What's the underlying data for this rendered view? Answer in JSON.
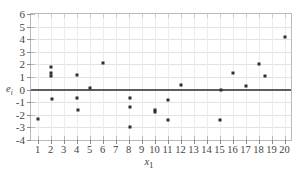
{
  "chart_data": {
    "type": "scatter",
    "title": "",
    "xlabel": "x1",
    "ylabel": "e_i",
    "xlim": [
      0.5,
      20.5
    ],
    "ylim": [
      -4,
      6
    ],
    "grid": true,
    "legend": null,
    "reference_line": {
      "axis": "y",
      "value": 0,
      "color": "#5d5d5d"
    },
    "marker_color": "#2f2f2f",
    "xticks": [
      1,
      2,
      3,
      4,
      5,
      6,
      7,
      8,
      9,
      10,
      11,
      12,
      13,
      14,
      15,
      16,
      17,
      18,
      19,
      20
    ],
    "xtick_labels": [
      "1",
      "2",
      "3",
      "4",
      "5",
      "6",
      "7",
      "8",
      "9",
      "10",
      "11",
      "12",
      "13",
      "14",
      "15",
      "16",
      "17",
      "18",
      "19",
      "20"
    ],
    "yticks": [
      -4,
      -3,
      -2,
      -1,
      0,
      1,
      2,
      3,
      4,
      5,
      6
    ],
    "ytick_labels": [
      "-4",
      "-3",
      "-2",
      "-1",
      "0",
      "1",
      "2",
      "3",
      "4",
      "5",
      "6"
    ],
    "points": [
      {
        "x": 1.05,
        "y": -2.3
      },
      {
        "x": 2.0,
        "y": 1.8
      },
      {
        "x": 2.0,
        "y": 1.3
      },
      {
        "x": 2.0,
        "y": 1.05
      },
      {
        "x": 2.1,
        "y": -0.75
      },
      {
        "x": 4.05,
        "y": 1.15
      },
      {
        "x": 4.05,
        "y": -0.7
      },
      {
        "x": 4.1,
        "y": -1.6
      },
      {
        "x": 5.05,
        "y": 0.1
      },
      {
        "x": 6.05,
        "y": 2.15
      },
      {
        "x": 8.1,
        "y": -0.65
      },
      {
        "x": 8.1,
        "y": -1.35
      },
      {
        "x": 8.15,
        "y": -3.0
      },
      {
        "x": 10.0,
        "y": -1.6
      },
      {
        "x": 10.05,
        "y": -1.8
      },
      {
        "x": 11.0,
        "y": -0.8
      },
      {
        "x": 11.05,
        "y": -2.4
      },
      {
        "x": 12.0,
        "y": 0.4
      },
      {
        "x": 15.05,
        "y": -2.4
      },
      {
        "x": 15.1,
        "y": 0.0
      },
      {
        "x": 16.05,
        "y": 1.35
      },
      {
        "x": 17.05,
        "y": 0.25
      },
      {
        "x": 18.05,
        "y": 2.05
      },
      {
        "x": 18.5,
        "y": 1.05
      },
      {
        "x": 20.0,
        "y": 4.2
      }
    ]
  }
}
